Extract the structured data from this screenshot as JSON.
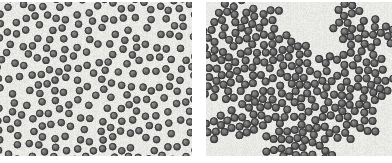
{
  "figure": {
    "kind": "two-panel-micrograph",
    "width": 392,
    "height": 163,
    "background_color": "#ffffff",
    "gap_px": 14,
    "panels": [
      {
        "id": "panel-left",
        "name": "dispersed-colloid-panel",
        "state_label": "dispersed",
        "x": 0,
        "y": 2,
        "width": 192,
        "height": 154,
        "background_color": "#e9e9e6",
        "particle": {
          "count": 255,
          "radius_px": 3.6,
          "fill_color": "#6c6c6c",
          "rim_color": "#3c3c3c",
          "highlight_color": "#8e8e8e",
          "rim_width_px": 0.9
        },
        "arrangement": "random-nonoverlapping",
        "min_center_distance_px": 8.6,
        "clustered": false,
        "seed": 20147
      },
      {
        "id": "panel-right",
        "name": "aggregated-colloid-panel",
        "state_label": "aggregated",
        "x": 206,
        "y": 2,
        "width": 186,
        "height": 154,
        "background_color": "#e9e9e6",
        "particle": {
          "count": 300,
          "radius_px": 3.9,
          "fill_color": "#6a6a6a",
          "rim_color": "#393939",
          "highlight_color": "#8c8c8c",
          "rim_width_px": 0.9
        },
        "arrangement": "diffusion-limited-cluster-aggregation",
        "contact_distance_px": 7.6,
        "clustered": true,
        "cluster_centers": [
          [
            96,
            84
          ],
          [
            70,
            52
          ],
          [
            120,
            60
          ],
          [
            52,
            104
          ],
          [
            134,
            112
          ],
          [
            40,
            28
          ],
          [
            150,
            34
          ],
          [
            96,
            130
          ],
          [
            24,
            70
          ],
          [
            166,
            80
          ]
        ],
        "seed": 87433
      }
    ],
    "noise": {
      "grain_amplitude": 9,
      "vertical_streak_amplitude": 5
    }
  }
}
